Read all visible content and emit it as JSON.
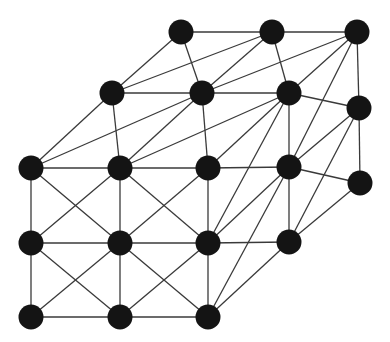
{
  "diagram": {
    "type": "graph",
    "width": 390,
    "height": 342,
    "colors": {
      "node": "#141414",
      "edge": "#3a3a3a",
      "background": "#ffffff"
    },
    "node_radius": 12.5,
    "nodes": {
      "T1": [
        181,
        32
      ],
      "T2": [
        272,
        32
      ],
      "T3": [
        357,
        32
      ],
      "S1": [
        112,
        93
      ],
      "S2": [
        202,
        93
      ],
      "S3": [
        289,
        93
      ],
      "S4": [
        359,
        108
      ],
      "F1": [
        31,
        168
      ],
      "F2": [
        120,
        168
      ],
      "F3": [
        208,
        168
      ],
      "F4": [
        289,
        167
      ],
      "F5": [
        360,
        183
      ],
      "M1": [
        31,
        243
      ],
      "M2": [
        120,
        243
      ],
      "M3": [
        208,
        243
      ],
      "M4": [
        289,
        242
      ],
      "B1": [
        31,
        317
      ],
      "B2": [
        120,
        317
      ],
      "B3": [
        208,
        317
      ]
    },
    "edges": [
      [
        "T1",
        "T2"
      ],
      [
        "T2",
        "T3"
      ],
      [
        "T1",
        "S1"
      ],
      [
        "T1",
        "S2"
      ],
      [
        "T2",
        "S1"
      ],
      [
        "T2",
        "S2"
      ],
      [
        "T2",
        "S3"
      ],
      [
        "T3",
        "S2"
      ],
      [
        "T3",
        "S3"
      ],
      [
        "T3",
        "S4"
      ],
      [
        "T3",
        "F4"
      ],
      [
        "S1",
        "S2"
      ],
      [
        "S2",
        "S3"
      ],
      [
        "S3",
        "S4"
      ],
      [
        "S1",
        "F1"
      ],
      [
        "S1",
        "F2"
      ],
      [
        "S2",
        "F1"
      ],
      [
        "S2",
        "F2"
      ],
      [
        "S2",
        "F3"
      ],
      [
        "S3",
        "F2"
      ],
      [
        "S3",
        "F3"
      ],
      [
        "S3",
        "M3"
      ],
      [
        "S3",
        "F4"
      ],
      [
        "S4",
        "F4"
      ],
      [
        "S4",
        "M4"
      ],
      [
        "S4",
        "F5"
      ],
      [
        "F1",
        "F2"
      ],
      [
        "F2",
        "F3"
      ],
      [
        "F3",
        "F4"
      ],
      [
        "F4",
        "F5"
      ],
      [
        "F1",
        "M1"
      ],
      [
        "F2",
        "M2"
      ],
      [
        "F3",
        "M3"
      ],
      [
        "F4",
        "M4"
      ],
      [
        "F5",
        "M4"
      ],
      [
        "F1",
        "M2"
      ],
      [
        "F2",
        "M1"
      ],
      [
        "F2",
        "M3"
      ],
      [
        "F3",
        "M2"
      ],
      [
        "F4",
        "M3"
      ],
      [
        "F4",
        "B3"
      ],
      [
        "M1",
        "M2"
      ],
      [
        "M2",
        "M3"
      ],
      [
        "M3",
        "M4"
      ],
      [
        "M1",
        "B1"
      ],
      [
        "M2",
        "B2"
      ],
      [
        "M3",
        "B3"
      ],
      [
        "M4",
        "B3"
      ],
      [
        "M1",
        "B2"
      ],
      [
        "M2",
        "B1"
      ],
      [
        "M2",
        "B3"
      ],
      [
        "M3",
        "B2"
      ],
      [
        "B1",
        "B2"
      ],
      [
        "B2",
        "B3"
      ]
    ]
  }
}
